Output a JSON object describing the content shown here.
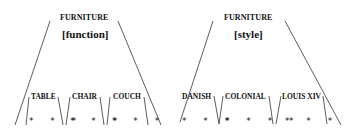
{
  "trees": [
    {
      "root": "FURNITURE",
      "feature": "[function]",
      "leaves": [
        {
          "label": "TABLE",
          "stars": "* * *"
        },
        {
          "label": "CHAIR",
          "stars": "* * *"
        },
        {
          "label": "COUCH",
          "stars": "* * *"
        }
      ]
    },
    {
      "root": "FURNITURE",
      "feature": "[style]",
      "leaves": [
        {
          "label": "DANISH",
          "stars": "* * *"
        },
        {
          "label": "COLONIAL",
          "stars": "* * * *"
        },
        {
          "label": "LOUIS XIV",
          "stars": "* * *"
        }
      ]
    }
  ],
  "colors": {
    "line": "#333333",
    "text": "#111111",
    "background": "#ffffff"
  }
}
